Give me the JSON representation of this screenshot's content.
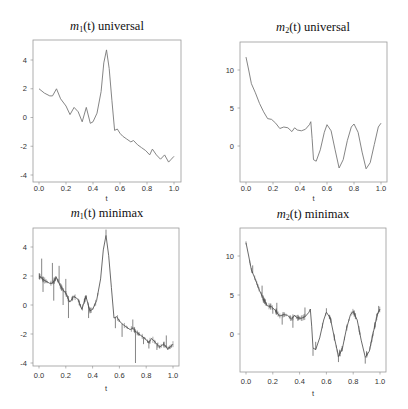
{
  "chart_data": [
    {
      "type": "line",
      "title": "m1(t) universal",
      "title_parts": {
        "func": "m",
        "sub": "1",
        "arg": "(t)",
        "method": "universal"
      },
      "xlabel": "t",
      "ylabel": "",
      "xlim": [
        0.0,
        1.0
      ],
      "ylim": [
        -4.3,
        5.2
      ],
      "xticks": [
        "0.0",
        "0.2",
        "0.4",
        "0.6",
        "0.8",
        "1.0"
      ],
      "yticks": [
        "-4",
        "-2",
        "0",
        "2",
        "4"
      ],
      "grid": false,
      "series": [
        {
          "name": "estimate",
          "style": "smooth",
          "x": [
            0.0,
            0.04,
            0.08,
            0.1,
            0.13,
            0.16,
            0.2,
            0.23,
            0.26,
            0.29,
            0.32,
            0.35,
            0.38,
            0.4,
            0.43,
            0.46,
            0.48,
            0.5,
            0.52,
            0.54,
            0.56,
            0.58,
            0.6,
            0.62,
            0.65,
            0.68,
            0.7,
            0.73,
            0.76,
            0.79,
            0.82,
            0.84,
            0.87,
            0.9,
            0.93,
            0.96,
            0.98,
            1.0
          ],
          "y": [
            2.0,
            1.7,
            1.5,
            1.5,
            2.0,
            1.3,
            0.8,
            0.2,
            0.7,
            0.4,
            -0.3,
            0.7,
            -0.4,
            -0.3,
            0.3,
            1.8,
            3.8,
            4.7,
            3.4,
            1.2,
            -0.9,
            -0.8,
            -1.1,
            -1.3,
            -1.5,
            -1.7,
            -1.6,
            -1.9,
            -2.1,
            -2.3,
            -2.6,
            -2.2,
            -2.6,
            -2.9,
            -2.6,
            -3.1,
            -2.9,
            -2.7
          ]
        }
      ]
    },
    {
      "type": "line",
      "title": "m2(t) universal",
      "title_parts": {
        "func": "m",
        "sub": "2",
        "arg": "(t)",
        "method": "universal"
      },
      "xlabel": "t",
      "ylabel": "",
      "xlim": [
        0.0,
        1.0
      ],
      "ylim": [
        -4.8,
        13.5
      ],
      "xticks": [
        "0.0",
        "0.2",
        "0.4",
        "0.6",
        "0.8",
        "1.0"
      ],
      "yticks": [
        "0",
        "5",
        "10"
      ],
      "grid": false,
      "series": [
        {
          "name": "estimate",
          "style": "smooth",
          "x": [
            0.0,
            0.02,
            0.04,
            0.07,
            0.1,
            0.13,
            0.16,
            0.19,
            0.22,
            0.25,
            0.28,
            0.31,
            0.34,
            0.36,
            0.38,
            0.41,
            0.44,
            0.47,
            0.48,
            0.49,
            0.5,
            0.52,
            0.55,
            0.58,
            0.6,
            0.63,
            0.66,
            0.69,
            0.72,
            0.75,
            0.78,
            0.8,
            0.83,
            0.86,
            0.89,
            0.92,
            0.95,
            0.98,
            1.0
          ],
          "y": [
            11.7,
            10.0,
            8.2,
            7.0,
            5.6,
            4.5,
            3.6,
            3.5,
            3.0,
            2.3,
            2.5,
            2.4,
            1.9,
            2.4,
            2.1,
            2.0,
            2.2,
            2.8,
            3.2,
            1.0,
            -1.8,
            -2.0,
            -0.5,
            1.8,
            2.8,
            2.0,
            -0.5,
            -2.9,
            -1.8,
            0.7,
            2.5,
            2.9,
            1.8,
            -0.8,
            -3.0,
            -2.2,
            0.2,
            2.5,
            3.0
          ]
        }
      ]
    },
    {
      "type": "line",
      "title": "m1(t) minimax",
      "title_parts": {
        "func": "m",
        "sub": "1",
        "arg": "(t)",
        "method": "minimax"
      },
      "xlabel": "t",
      "ylabel": "",
      "xlim": [
        0.0,
        1.0
      ],
      "ylim": [
        -4.3,
        5.2
      ],
      "xticks": [
        "0.0",
        "0.2",
        "0.4",
        "0.6",
        "0.8",
        "1.0"
      ],
      "yticks": [
        "-4",
        "-2",
        "0",
        "2",
        "4"
      ],
      "grid": false,
      "series": [
        {
          "name": "estimate",
          "style": "noisy",
          "x": [
            0.0,
            0.04,
            0.08,
            0.1,
            0.13,
            0.16,
            0.2,
            0.23,
            0.26,
            0.29,
            0.32,
            0.35,
            0.38,
            0.4,
            0.43,
            0.46,
            0.48,
            0.5,
            0.52,
            0.54,
            0.56,
            0.58,
            0.6,
            0.62,
            0.65,
            0.68,
            0.7,
            0.73,
            0.76,
            0.79,
            0.82,
            0.84,
            0.87,
            0.9,
            0.93,
            0.96,
            0.98,
            1.0
          ],
          "y": [
            2.0,
            1.7,
            1.5,
            1.5,
            1.9,
            1.3,
            0.8,
            0.2,
            0.6,
            0.4,
            -0.3,
            0.6,
            -0.4,
            -0.3,
            0.3,
            1.8,
            3.8,
            4.8,
            3.4,
            1.2,
            -0.9,
            -0.8,
            -1.1,
            -1.3,
            -1.5,
            -1.7,
            -1.6,
            -1.9,
            -2.1,
            -2.3,
            -2.6,
            -2.3,
            -2.6,
            -2.9,
            -2.7,
            -3.0,
            -2.9,
            -2.7
          ],
          "spikes": [
            [
              0.02,
              3.2
            ],
            [
              0.03,
              0.9
            ],
            [
              0.1,
              2.9
            ],
            [
              0.11,
              0.3
            ],
            [
              0.15,
              2.7
            ],
            [
              0.18,
              0.0
            ],
            [
              0.2,
              1.8
            ],
            [
              0.22,
              -0.9
            ],
            [
              0.37,
              -0.9
            ],
            [
              0.5,
              5.2
            ],
            [
              0.57,
              -1.6
            ],
            [
              0.62,
              -2.2
            ],
            [
              0.7,
              -1.0
            ],
            [
              0.72,
              -4.0
            ],
            [
              0.78,
              -2.7
            ],
            [
              0.82,
              -3.0
            ],
            [
              0.88,
              -3.1
            ],
            [
              0.95,
              -2.1
            ],
            [
              0.96,
              -3.1
            ]
          ]
        }
      ]
    },
    {
      "type": "line",
      "title": "m2(t) minimax",
      "title_parts": {
        "func": "m",
        "sub": "2",
        "arg": "(t)",
        "method": "minimax"
      },
      "xlabel": "t",
      "ylabel": "",
      "xlim": [
        0.0,
        1.0
      ],
      "ylim": [
        -4.8,
        13.5
      ],
      "xticks": [
        "0.0",
        "0.2",
        "0.4",
        "0.6",
        "0.8",
        "1.0"
      ],
      "yticks": [
        "0",
        "5",
        "10"
      ],
      "grid": false,
      "series": [
        {
          "name": "estimate",
          "style": "noisy",
          "x": [
            0.0,
            0.02,
            0.04,
            0.07,
            0.1,
            0.13,
            0.16,
            0.19,
            0.22,
            0.25,
            0.28,
            0.31,
            0.34,
            0.36,
            0.38,
            0.41,
            0.44,
            0.47,
            0.48,
            0.49,
            0.5,
            0.52,
            0.55,
            0.58,
            0.6,
            0.63,
            0.66,
            0.69,
            0.72,
            0.75,
            0.78,
            0.8,
            0.83,
            0.86,
            0.89,
            0.92,
            0.95,
            0.98,
            1.0
          ],
          "y": [
            11.7,
            10.0,
            8.2,
            7.0,
            5.6,
            4.5,
            3.6,
            3.5,
            3.0,
            2.3,
            2.5,
            2.4,
            1.9,
            2.4,
            2.1,
            2.0,
            2.2,
            2.8,
            3.2,
            1.0,
            -1.8,
            -2.0,
            -0.5,
            1.8,
            2.8,
            2.0,
            -0.5,
            -2.9,
            -1.8,
            0.7,
            2.5,
            2.9,
            1.8,
            -0.8,
            -3.0,
            -2.2,
            0.2,
            2.5,
            3.2
          ],
          "spikes": [
            [
              0.05,
              8.8
            ],
            [
              0.12,
              6.2
            ],
            [
              0.13,
              4.0
            ],
            [
              0.2,
              2.6
            ],
            [
              0.23,
              4.0
            ],
            [
              0.27,
              1.2
            ],
            [
              0.35,
              0.8
            ],
            [
              0.44,
              3.4
            ],
            [
              0.5,
              -2.8
            ],
            [
              0.52,
              -1.0
            ],
            [
              0.6,
              3.3
            ],
            [
              0.69,
              -3.6
            ],
            [
              0.7,
              -2.0
            ],
            [
              0.89,
              -3.8
            ],
            [
              0.9,
              -2.2
            ],
            [
              0.99,
              3.6
            ]
          ]
        }
      ]
    }
  ]
}
